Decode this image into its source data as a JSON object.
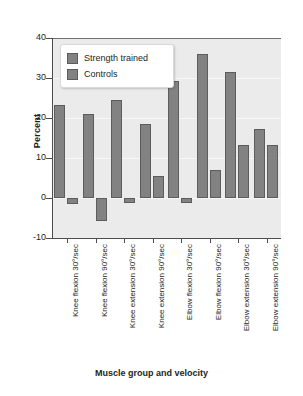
{
  "chart_data": {
    "type": "bar",
    "title": "",
    "xlabel": "Muscle group and velocity",
    "ylabel": "Percent",
    "ylim": [
      -10,
      40
    ],
    "yticks": [
      -10,
      0,
      10,
      20,
      30,
      40
    ],
    "ytick_labels": [
      "-10",
      "0",
      "10",
      "20",
      "30",
      "40"
    ],
    "grid": true,
    "legend_position": "top-left",
    "categories": [
      "Knee flexion 30°/sec",
      "Knee flexion 90°/sec",
      "Knee extension 30°/sec",
      "Knee extension 90°/sec",
      "Elbow flexion 30°/sec",
      "Elbow flexion 90°/sec",
      "Elbow extension 30°/sec",
      "Elbow extension 90°/sec"
    ],
    "series": [
      {
        "name": "Strength trained",
        "color": "#828282",
        "values": [
          23.3,
          21.0,
          24.5,
          18.4,
          29.3,
          36.0,
          31.5,
          17.2
        ]
      },
      {
        "name": "Controls",
        "color": "#828282",
        "values": [
          -1.5,
          -5.7,
          -1.2,
          5.4,
          -1.2,
          7.0,
          13.2,
          13.2
        ]
      }
    ]
  },
  "colors": {
    "bar_fill": "#828282",
    "bar_edge": "#5c5c5c",
    "plot_background": "#ebebeb",
    "gridline": "#f7f7f7",
    "axis": "#4d4d4d",
    "zero_line": "#6f6f6f",
    "text": "#231f20",
    "legend_background": "#ffffff"
  }
}
